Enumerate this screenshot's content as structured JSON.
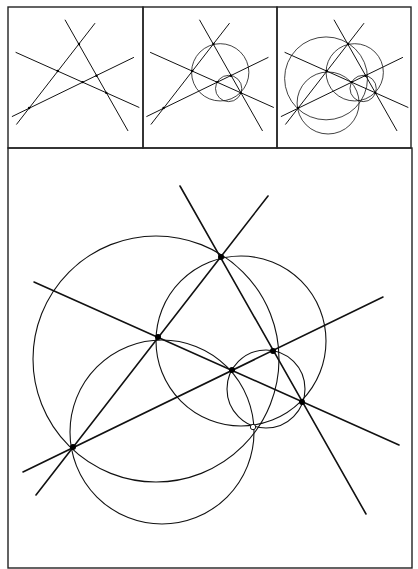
{
  "figure": {
    "colors": {
      "ink": "#111111",
      "background": "#ffffff",
      "frame": "#222222"
    },
    "panels": [
      {
        "id": "step-1",
        "label": "",
        "shows": [
          "lines",
          "points"
        ]
      },
      {
        "id": "step-2",
        "label": "",
        "shows": [
          "lines",
          "points",
          "circle_upper_right",
          "circle_small"
        ]
      },
      {
        "id": "step-3",
        "label": "",
        "shows": [
          "lines",
          "points",
          "all_circles"
        ]
      },
      {
        "id": "main",
        "label": "",
        "shows": [
          "lines",
          "points",
          "all_circles",
          "miquel_point"
        ]
      }
    ],
    "lines": [
      {
        "id": "L1",
        "x1": 180,
        "y1": 186,
        "x2": 366,
        "y2": 514
      },
      {
        "id": "L2",
        "x1": 268,
        "y1": 196,
        "x2": 36,
        "y2": 495
      },
      {
        "id": "L3",
        "x1": 34,
        "y1": 282,
        "x2": 399,
        "y2": 445
      },
      {
        "id": "L4",
        "x1": 383,
        "y1": 297,
        "x2": 23,
        "y2": 472
      }
    ],
    "points": [
      {
        "id": "A",
        "x": 221,
        "y": 257
      },
      {
        "id": "B",
        "x": 158,
        "y": 337
      },
      {
        "id": "C",
        "x": 232,
        "y": 370
      },
      {
        "id": "D",
        "x": 273,
        "y": 351
      },
      {
        "id": "E",
        "x": 302,
        "y": 402
      },
      {
        "id": "F",
        "x": 73,
        "y": 447
      }
    ],
    "miquel_point": {
      "id": "M",
      "x": 253,
      "y": 427,
      "style": "open"
    },
    "circles": [
      {
        "id": "circle_big_left",
        "cx": 156,
        "cy": 359,
        "r": 123
      },
      {
        "id": "circle_upper_right",
        "cx": 241,
        "cy": 341,
        "r": 85
      },
      {
        "id": "circle_bottom",
        "cx": 162,
        "cy": 432,
        "r": 92
      },
      {
        "id": "circle_small",
        "cx": 266,
        "cy": 389,
        "r": 39
      }
    ],
    "thumb_transform": {
      "scale": 0.337,
      "offsets": [
        [
          4.5,
          -42.6
        ],
        [
          139,
          -42.6
        ],
        [
          273.5,
          -42.6
        ]
      ]
    }
  }
}
